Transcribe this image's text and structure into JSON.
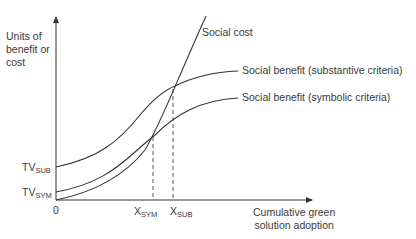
{
  "diagram": {
    "y_axis_label": [
      "Units of",
      "benefit or",
      "cost"
    ],
    "x_axis_label": [
      "Cumulative green",
      "solution adoption"
    ],
    "origin_label": "0",
    "y_ticks": [
      {
        "main": "TV",
        "sub": "SUB"
      },
      {
        "main": "TV",
        "sub": "SYM"
      }
    ],
    "x_ticks": [
      {
        "main": "X",
        "sub": "SYM"
      },
      {
        "main": "X",
        "sub": "SUB"
      }
    ],
    "curves": {
      "social_cost": "Social cost",
      "benefit_substantive": "Social benefit (substantive criteria)",
      "benefit_symbolic": "Social benefit (symbolic criteria)"
    },
    "colors": {
      "line": "#333333",
      "text": "#3a3a3a"
    }
  }
}
